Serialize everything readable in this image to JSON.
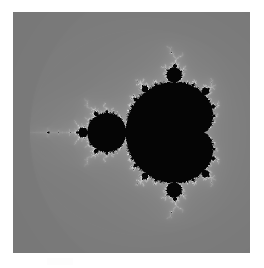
{
  "page": {
    "width": 264,
    "height": 268,
    "background_color": "#ffffff"
  },
  "figure": {
    "name": "mandelbrot-set-render",
    "x": 13,
    "y": 12,
    "width": 237,
    "height": 241,
    "alt": "Grayscale Mandelbrot set fractal with concentric escape-time bands"
  },
  "artifact": {
    "label": "",
    "x": 47,
    "y": 258,
    "width": 26,
    "height": 7,
    "color": "#e2e2e2"
  },
  "chart_data": {
    "type": "heatmap",
    "subtitle": "Escape-time rendering, grayscale",
    "xlabel": "Re(c)",
    "ylabel": "Im(c)",
    "xlim": [
      -2.22,
      0.86
    ],
    "ylim": [
      -1.56,
      1.56
    ],
    "grid": false,
    "legend": "none",
    "max_iterations": 80,
    "escape_radius": 2.0,
    "interior_color": "#050505",
    "colormap": "grayscale-banded",
    "colormap_stops": [
      {
        "t": 0.0,
        "color": "#6e6e6e"
      },
      {
        "t": 0.14,
        "color": "#787878"
      },
      {
        "t": 0.28,
        "color": "#848484"
      },
      {
        "t": 0.42,
        "color": "#949494"
      },
      {
        "t": 0.56,
        "color": "#a8a8a8"
      },
      {
        "t": 0.7,
        "color": "#c2c2c2"
      },
      {
        "t": 0.82,
        "color": "#dcdcdc"
      },
      {
        "t": 0.92,
        "color": "#ececec"
      },
      {
        "t": 1.0,
        "color": "#f4f4f4"
      }
    ],
    "features": [
      {
        "name": "main-cardioid",
        "center_re": -0.1,
        "center_im": 0.0,
        "period": 1
      },
      {
        "name": "period-2-bulb",
        "center_re": -1.0,
        "center_im": 0.0,
        "period": 2
      },
      {
        "name": "period-3-bulb-upper",
        "center_re": -0.125,
        "center_im": 0.744,
        "period": 3
      },
      {
        "name": "period-3-bulb-lower",
        "center_re": -0.125,
        "center_im": -0.744,
        "period": 3
      },
      {
        "name": "needle-antenna-tip",
        "center_re": -2.0,
        "center_im": 0.0,
        "period": 0
      }
    ]
  }
}
